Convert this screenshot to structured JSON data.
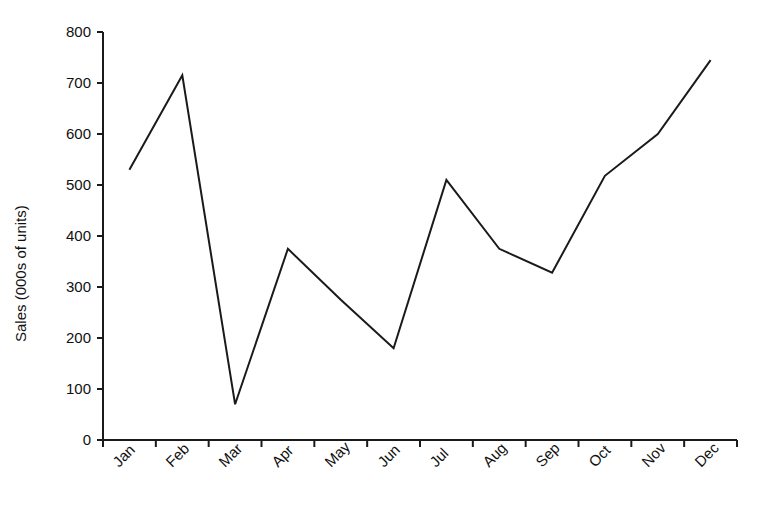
{
  "chart_data": {
    "type": "line",
    "title": "",
    "subtitle": "",
    "xlabel": "",
    "ylabel": "Sales (000s of units)",
    "categories": [
      "Jan",
      "Feb",
      "Mar",
      "Apr",
      "May",
      "Jun",
      "Jul",
      "Aug",
      "Sep",
      "Oct",
      "Nov",
      "Dec"
    ],
    "values": [
      530,
      715,
      70,
      375,
      275,
      180,
      510,
      375,
      328,
      518,
      600,
      745
    ],
    "series": [
      {
        "name": "Sales",
        "values": [
          530,
          715,
          70,
          375,
          275,
          180,
          510,
          375,
          328,
          518,
          600,
          745
        ]
      }
    ],
    "ylim": [
      0,
      800
    ],
    "yticks": [
      0,
      100,
      200,
      300,
      400,
      500,
      600,
      700,
      800
    ],
    "ytick_labels": [
      "0",
      "100",
      "200",
      "300",
      "400",
      "500",
      "600",
      "700",
      "800"
    ],
    "xtick_labels": [
      "Jan",
      "Feb",
      "Mar",
      "Apr",
      "May",
      "Jun",
      "Jul",
      "Aug",
      "Sep",
      "Oct",
      "Nov",
      "Dec"
    ],
    "xtick_rotation": -45,
    "grid": false,
    "legend": false,
    "legend_position": "none",
    "markers": false,
    "line_color": "#1a1a1a",
    "line_width": 2,
    "axis_color": "#1a1a1a",
    "background_color": "#ffffff"
  },
  "axes": {
    "y_title": "Sales (000s of units)"
  }
}
